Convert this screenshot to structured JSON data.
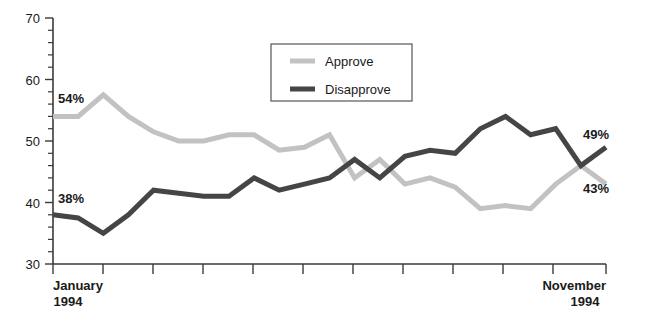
{
  "chart_data": {
    "type": "line",
    "title": "",
    "subtitle": "",
    "xlabel": "",
    "ylabel": "",
    "ylim": [
      30,
      70
    ],
    "y_major_ticks": [
      30,
      40,
      50,
      60,
      70
    ],
    "y_minor_tick_step": 2,
    "grid": false,
    "legend_position": "top-center",
    "x_axis_start_label": "January",
    "x_axis_start_year": "1994",
    "x_axis_end_label": "November",
    "x_axis_end_year": "1994",
    "x_tick_count": 12,
    "x": [
      1,
      2,
      3,
      4,
      5,
      6,
      7,
      8,
      9,
      10,
      11,
      12,
      13,
      14,
      15,
      16,
      17,
      18,
      19,
      20,
      21,
      22,
      23
    ],
    "series": [
      {
        "name": "Approve",
        "color": "#c2c2c2",
        "stroke_width": 5,
        "values": [
          54,
          54,
          57.5,
          54,
          51.5,
          50,
          50,
          51,
          51,
          48.5,
          49,
          51,
          44,
          47,
          43,
          44,
          42.5,
          39,
          39.5,
          39,
          43,
          46,
          43
        ],
        "start_label": "54%",
        "end_label": "43%"
      },
      {
        "name": "Disapprove",
        "color": "#454545",
        "stroke_width": 5,
        "values": [
          38,
          37.5,
          35,
          38,
          42,
          41.5,
          41,
          41,
          44,
          42,
          43,
          44,
          47,
          44,
          47.5,
          48.5,
          48,
          52,
          54,
          51,
          52,
          46,
          49
        ],
        "start_label": "38%",
        "end_label": "49%"
      }
    ],
    "annotations": [
      {
        "text": "54%",
        "series": "Approve",
        "position": "start"
      },
      {
        "text": "38%",
        "series": "Disapprove",
        "position": "start"
      },
      {
        "text": "49%",
        "series": "Disapprove",
        "position": "end"
      },
      {
        "text": "43%",
        "series": "Approve",
        "position": "end"
      }
    ]
  },
  "legend": {
    "items": [
      {
        "label": "Approve",
        "color": "#c2c2c2"
      },
      {
        "label": "Disapprove",
        "color": "#454545"
      }
    ]
  },
  "axis": {
    "y_labels": [
      "70",
      "60",
      "50",
      "40",
      "30"
    ],
    "x_left_month": "January",
    "x_left_year": "1994",
    "x_right_month": "November",
    "x_right_year": "1994"
  }
}
